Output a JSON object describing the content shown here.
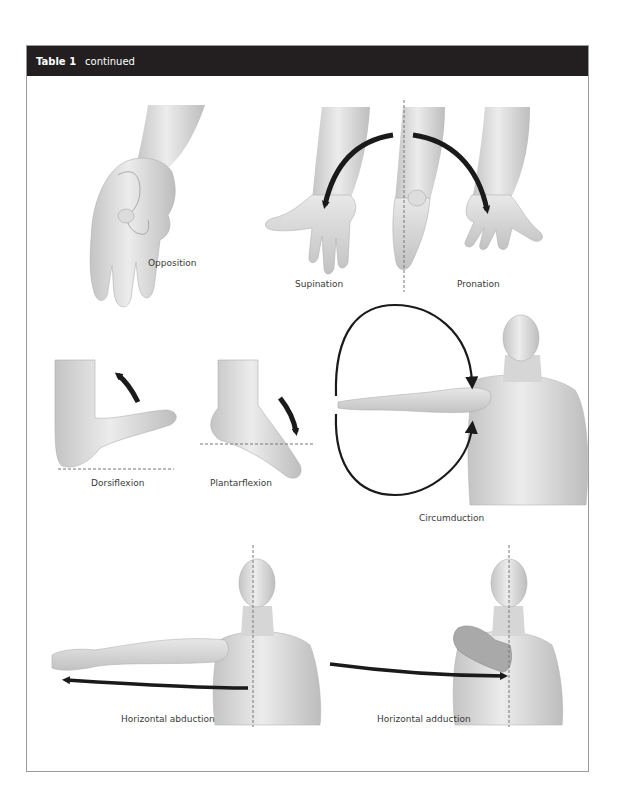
{
  "table": {
    "number": "Table 1",
    "status": "continued",
    "header_bg": "#231f20",
    "header_fg": "#ffffff"
  },
  "movements": [
    {
      "id": "opposition",
      "label": "Opposition",
      "body_part": "hand"
    },
    {
      "id": "supination",
      "label": "Supination",
      "body_part": "forearm"
    },
    {
      "id": "pronation",
      "label": "Pronation",
      "body_part": "forearm"
    },
    {
      "id": "dorsiflexion",
      "label": "Dorsiflexion",
      "body_part": "foot"
    },
    {
      "id": "plantarflexion",
      "label": "Plantarflexion",
      "body_part": "foot"
    },
    {
      "id": "circumduction",
      "label": "Circumduction",
      "body_part": "shoulder"
    },
    {
      "id": "horizontal-abduction",
      "label": "Horizontal abduction",
      "body_part": "shoulder"
    },
    {
      "id": "horizontal-adduction",
      "label": "Horizontal adduction",
      "body_part": "shoulder"
    }
  ],
  "colors": {
    "skin": "#d9d9d9",
    "skin_shade": "#b5b5b5",
    "arrow": "#1a1a1a",
    "dashed_line": "#777777",
    "label_text": "#3a3a3a",
    "border": "#9a9a9a"
  }
}
